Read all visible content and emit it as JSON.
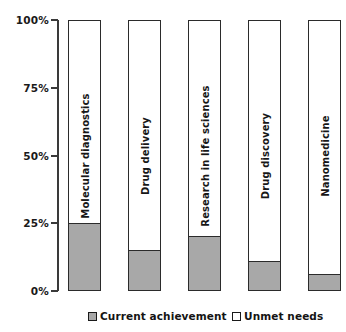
{
  "chart_data": {
    "type": "bar",
    "title": "",
    "subtitle": "",
    "xlabel": "",
    "ylabel": "",
    "stacked": true,
    "stack_total": 100,
    "grid": false,
    "legend_position": "bottom",
    "ylim": [
      0,
      100
    ],
    "yticks": [
      0,
      25,
      50,
      75,
      100
    ],
    "ytick_labels": [
      "0%",
      "25%",
      "50%",
      "75%",
      "100%"
    ],
    "categories": [
      "Molecular diagnostics",
      "Drug delivery",
      "Research in life sciences",
      "Drug discovery",
      "Nanomedicine"
    ],
    "series": [
      {
        "name": "Current achievement",
        "color": "#a8a8a8",
        "values": [
          25,
          15,
          20,
          11,
          6
        ]
      },
      {
        "name": "Unmet needs",
        "color": "#ffffff",
        "values": [
          75,
          85,
          80,
          89,
          94
        ]
      }
    ],
    "annotations": []
  },
  "legend": {
    "items": [
      {
        "label": "Current achievement",
        "swatch": "gray"
      },
      {
        "label": "Unmet needs",
        "swatch": "white"
      }
    ]
  },
  "colors": {
    "achievement_fill": "#a8a8a8",
    "unmet_fill": "#ffffff",
    "outline": "#2b2b2b",
    "axis": "#3a3a3a",
    "text": "#171717",
    "background": "#ffffff"
  }
}
